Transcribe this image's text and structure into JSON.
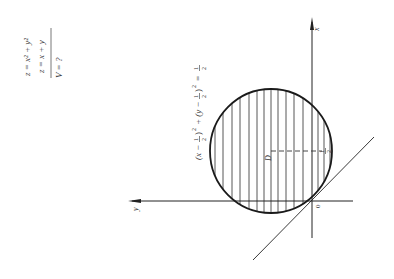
{
  "problem": {
    "surface1": "z = x² + y²",
    "surface2": "z = x + y",
    "question": "V = ?"
  },
  "diagram": {
    "axis_x_label": "x",
    "axis_y_label": "y",
    "origin_label": "0",
    "region_label": "D",
    "tick_label_half": "1/2",
    "tick_num": "1",
    "tick_den": "2",
    "circle_equation": "(x − 1/2)² + (y − 1/2)² = 1/2",
    "eq_parts": {
      "p1": "(x −",
      "f1n": "1",
      "f1d": "2",
      "p2": ")",
      "sq1": "2",
      "plus": "+ (y −",
      "f2n": "1",
      "f2d": "2",
      "p3": ")",
      "sq2": "2",
      "eq": "=",
      "f3n": "1",
      "f3d": "2"
    },
    "colors": {
      "line": "#222222",
      "hatch": "#444444",
      "background": "#ffffff"
    }
  }
}
